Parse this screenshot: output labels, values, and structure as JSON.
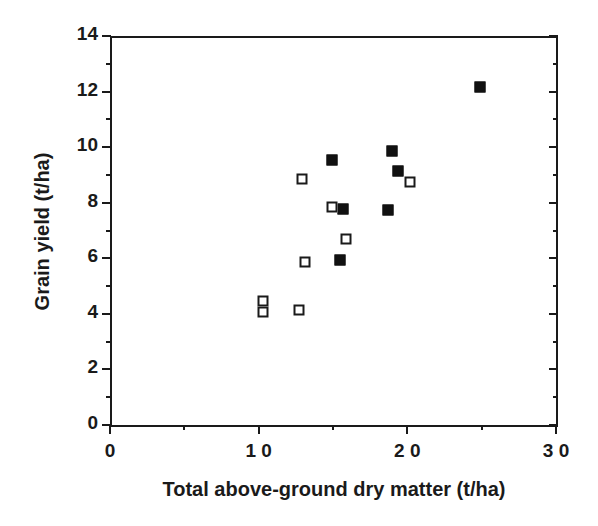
{
  "chart_data": {
    "type": "scatter",
    "title": "",
    "xlabel": "Total above-ground dry matter (t/ha)",
    "ylabel": "Grain yield (t/ha)",
    "xlim": [
      0,
      3.0
    ],
    "ylim": [
      0,
      14
    ],
    "grid": false,
    "legend": "none",
    "x_ticks": [
      {
        "value": 0,
        "label": "0"
      },
      {
        "value": 1.0,
        "label": "1 0"
      },
      {
        "value": 2.0,
        "label": "2 0"
      },
      {
        "value": 3.0,
        "label": "3 0"
      }
    ],
    "x_minor_ticks": [
      0.5,
      1.5,
      2.5
    ],
    "y_ticks": [
      {
        "value": 0,
        "label": "0"
      },
      {
        "value": 2,
        "label": "2"
      },
      {
        "value": 4,
        "label": "4"
      },
      {
        "value": 6,
        "label": "6"
      },
      {
        "value": 8,
        "label": "8"
      },
      {
        "value": 10,
        "label": "10"
      },
      {
        "value": 12,
        "label": "12"
      },
      {
        "value": 14,
        "label": "14"
      }
    ],
    "y_minor_ticks": [
      1,
      3,
      5,
      7,
      9,
      11,
      13
    ],
    "series": [
      {
        "name": "filled-squares",
        "marker": "filled-square",
        "color": "#111111",
        "points": [
          {
            "x": 1.49,
            "y": 9.55
          },
          {
            "x": 1.57,
            "y": 7.78
          },
          {
            "x": 1.55,
            "y": 5.95
          },
          {
            "x": 1.87,
            "y": 7.75
          },
          {
            "x": 1.9,
            "y": 9.85
          },
          {
            "x": 1.94,
            "y": 9.15
          },
          {
            "x": 2.49,
            "y": 12.15
          }
        ]
      },
      {
        "name": "open-squares",
        "marker": "open-square",
        "color": "#1a1a1a",
        "points": [
          {
            "x": 1.03,
            "y": 4.45
          },
          {
            "x": 1.03,
            "y": 4.05
          },
          {
            "x": 1.27,
            "y": 4.15
          },
          {
            "x": 1.29,
            "y": 8.85
          },
          {
            "x": 1.31,
            "y": 5.85
          },
          {
            "x": 1.49,
            "y": 7.85
          },
          {
            "x": 1.59,
            "y": 6.7
          },
          {
            "x": 2.02,
            "y": 8.75
          }
        ]
      }
    ]
  }
}
